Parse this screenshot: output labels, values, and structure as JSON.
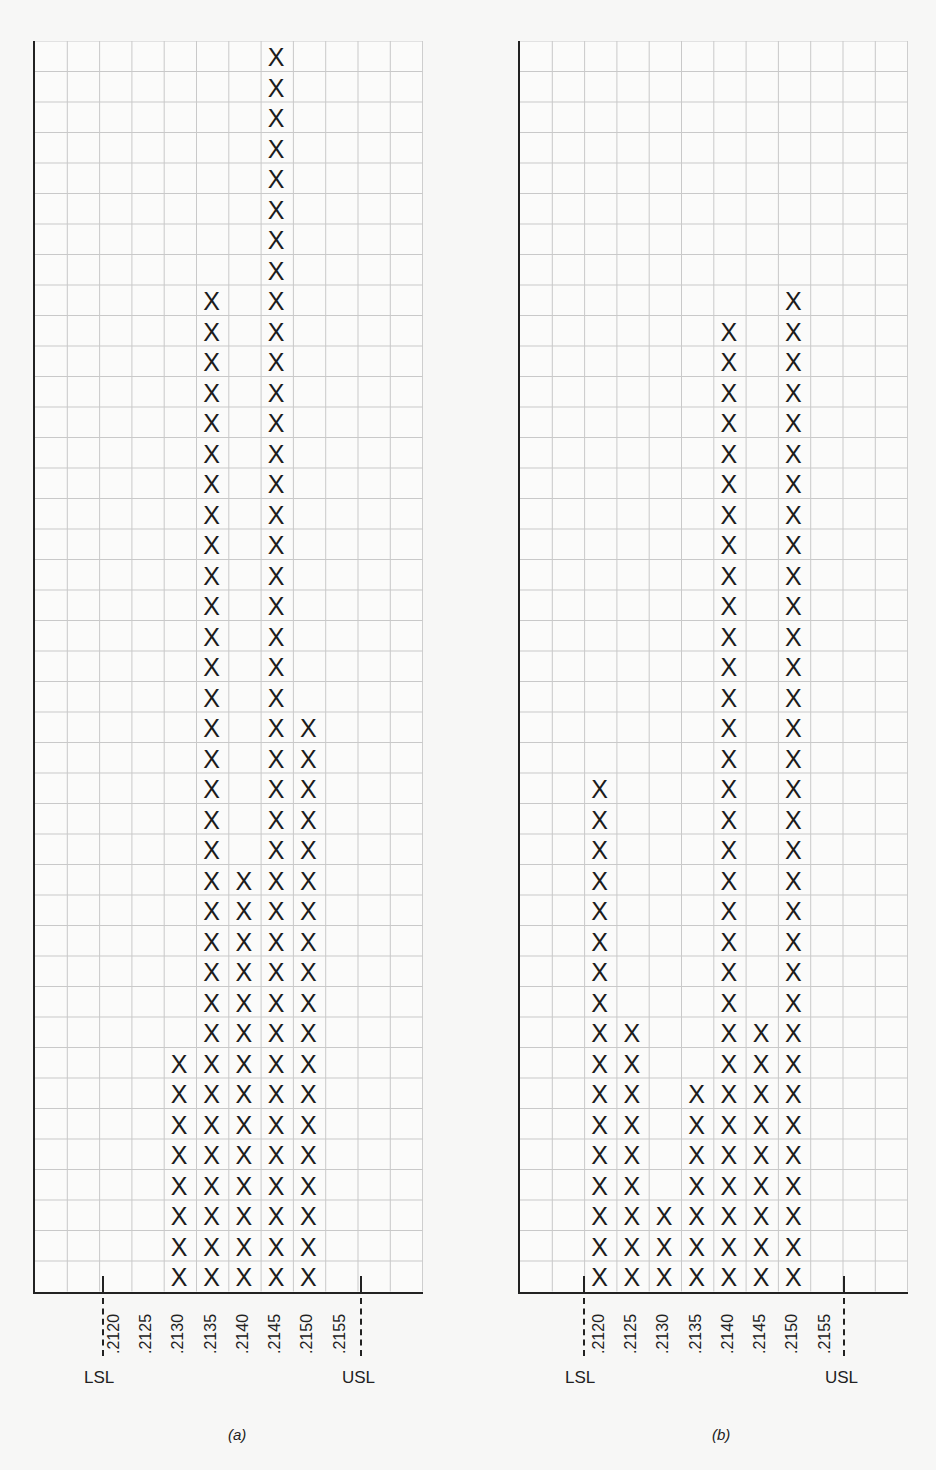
{
  "chart_data": [
    {
      "type": "bar",
      "subtype": "tally-histogram",
      "title": "(a)",
      "categories": [
        ".2120",
        ".2125",
        ".2130",
        ".2135",
        ".2140",
        ".2145",
        ".2150",
        ".2155"
      ],
      "values": [
        0,
        0,
        8,
        33,
        14,
        41,
        19,
        0
      ],
      "xlabel": "",
      "ylabel": "",
      "ylim": [
        0,
        41
      ],
      "grid": true,
      "spec_limits": {
        "LSL": ".2120",
        "USL": ".2155"
      },
      "marker": "X"
    },
    {
      "type": "bar",
      "subtype": "tally-histogram",
      "title": "(b)",
      "categories": [
        ".2120",
        ".2125",
        ".2130",
        ".2135",
        ".2140",
        ".2145",
        ".2150",
        ".2155"
      ],
      "values": [
        17,
        9,
        3,
        7,
        32,
        9,
        33,
        0
      ],
      "xlabel": "",
      "ylabel": "",
      "ylim": [
        0,
        41
      ],
      "grid": true,
      "spec_limits": {
        "LSL": ".2120",
        "USL": ".2155"
      },
      "marker": "X"
    }
  ],
  "labels": {
    "lsl": "LSL",
    "usl": "USL",
    "marker": "X",
    "caption_a": "(a)",
    "caption_b": "(b)"
  },
  "colors": {
    "ink": "#1c1c1c",
    "grid": "#c9c9c9",
    "paper": "#f7f7f6"
  }
}
